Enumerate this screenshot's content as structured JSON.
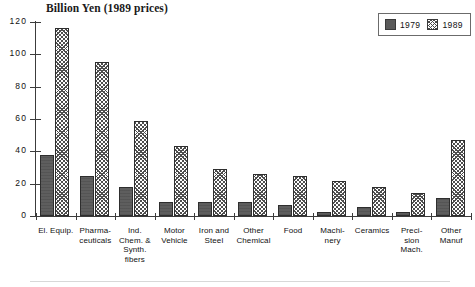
{
  "chart_data": {
    "type": "bar",
    "title": "Billion Yen (1989 prices)",
    "xlabel": "",
    "ylabel": "",
    "ylim": [
      0,
      120
    ],
    "yticks": [
      0,
      20,
      40,
      60,
      80,
      100,
      120
    ],
    "grid": false,
    "legend_position": "top-right",
    "categories": [
      "El. Equip.",
      "Pharma-\nceuticals",
      "Ind.\nChem. &\nSynth.\nfibers",
      "Motor\nVehicle",
      "Iron and\nSteel",
      "Other\nChemical",
      "Food",
      "Machi-\nnery",
      "Ceramics",
      "Preci-\nsion\nMach.",
      "Other\nManuf"
    ],
    "series": [
      {
        "name": "1979",
        "color": "#5e5e5e",
        "pattern": "solid-dark-gray",
        "values": [
          38,
          25,
          18,
          8.5,
          8.5,
          8.5,
          7,
          2.5,
          5.5,
          2.5,
          11
        ]
      },
      {
        "name": "1989",
        "color": "#4e4e4e",
        "pattern": "crosshatch",
        "values": [
          116,
          95,
          59,
          43,
          29,
          26,
          24.5,
          21.5,
          18,
          14,
          47
        ]
      }
    ]
  },
  "legend": {
    "entries": [
      {
        "label": "1979",
        "swatch": "solid-dark-gray-swatch"
      },
      {
        "label": "1989",
        "swatch": "crosshatch-swatch"
      }
    ]
  },
  "axis": {
    "y_tick_labels": [
      "120",
      "100",
      "80",
      "60",
      "40",
      "20",
      "0"
    ]
  }
}
